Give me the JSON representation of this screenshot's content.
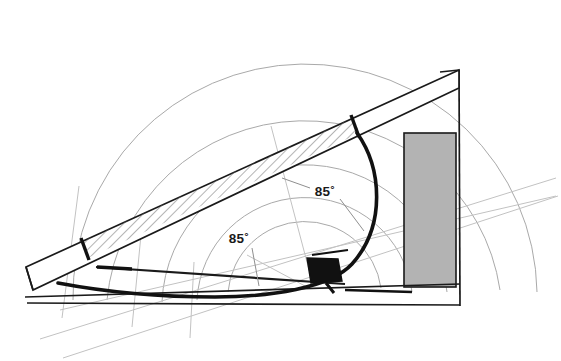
{
  "diagram": {
    "background_color": "#ffffff",
    "annotations": [
      {
        "id": "angle-left",
        "text": "85˚",
        "value": 85,
        "unit": "degrees",
        "x": 248,
        "y": 240
      },
      {
        "id": "angle-right",
        "text": "85˚",
        "value": 85,
        "unit": "degrees",
        "x": 324,
        "y": 193
      }
    ],
    "colors": {
      "outline": "#1a1a1a",
      "panel_fill": "#b3b3b3",
      "panel_stroke": "#1a1a1a",
      "arc_guide": "#a8a8a8",
      "light_guide": "#c9c9c9",
      "hatch": "#555555",
      "motor_fill": "#111111",
      "arm": "#111111"
    },
    "parts": {
      "hatched_beam": "hatched-diagonal-beam",
      "wedge_frame": "wedge-frame",
      "vertical_wall": "vertical-wall",
      "gray_panel": "gray-panel",
      "curved_arm": "curved-actuator-arm",
      "motor_block": "motor-block",
      "lower_rod": "lower-rod",
      "pivot": "pivot-point",
      "guide_arcs": "concentric-guide-arcs",
      "guide_lines": "guide-lines"
    }
  }
}
